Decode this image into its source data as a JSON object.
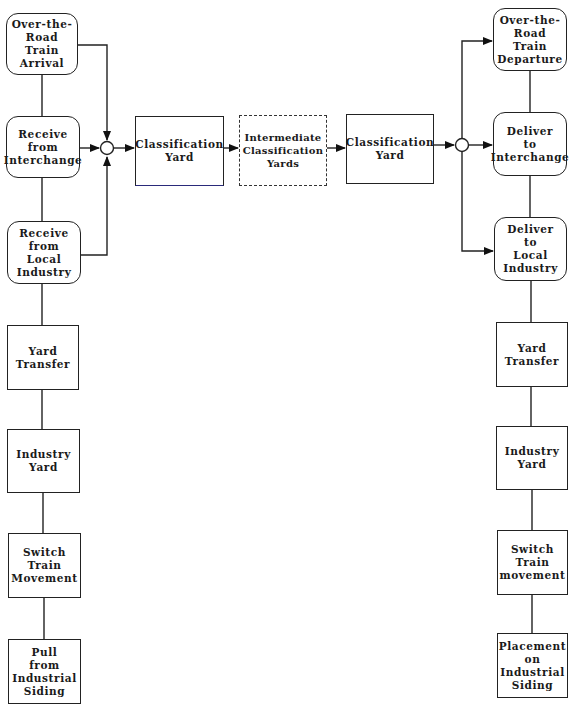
{
  "diagram": {
    "left_column": [
      {
        "id": "otr-arrival",
        "label": "Over-the-\nRoad\nTrain\nArrival",
        "shape": "rounded"
      },
      {
        "id": "receive-interchange",
        "label": "Receive\nfrom\nInterchange",
        "shape": "rounded"
      },
      {
        "id": "receive-local-industry",
        "label": "Receive\nfrom\nLocal\nIndustry",
        "shape": "rounded"
      },
      {
        "id": "yard-transfer-left",
        "label": "Yard\nTransfer",
        "shape": "rect"
      },
      {
        "id": "industry-yard-left",
        "label": "Industry\nYard",
        "shape": "rect"
      },
      {
        "id": "switch-train-left",
        "label": "Switch\nTrain\nMovement",
        "shape": "rect"
      },
      {
        "id": "pull-from-siding",
        "label": "Pull\nfrom\nIndustrial\nSiding",
        "shape": "rect"
      }
    ],
    "center_row": [
      {
        "id": "classification-yard-1",
        "label": "Classification\nYard",
        "shape": "rect"
      },
      {
        "id": "intermediate-yards",
        "label": "Intermediate\nClassification\nYards",
        "shape": "dashed"
      },
      {
        "id": "classification-yard-2",
        "label": "Classification\nYard",
        "shape": "rect"
      }
    ],
    "right_column": [
      {
        "id": "otr-departure",
        "label": "Over-the-\nRoad\nTrain\nDeparture",
        "shape": "rounded"
      },
      {
        "id": "deliver-interchange",
        "label": "Deliver\nto\nInterchange",
        "shape": "rounded"
      },
      {
        "id": "deliver-local-industry",
        "label": "Deliver\nto\nLocal\nIndustry",
        "shape": "rounded"
      },
      {
        "id": "yard-transfer-right",
        "label": "Yard\nTransfer",
        "shape": "rect"
      },
      {
        "id": "industry-yard-right",
        "label": "Industry\nYard",
        "shape": "rect"
      },
      {
        "id": "switch-train-right",
        "label": "Switch\nTrain\nmovement",
        "shape": "rect"
      },
      {
        "id": "placement-on-siding",
        "label": "Placement\non\nIndustrial\nSiding",
        "shape": "rect"
      }
    ],
    "junctions": [
      "merge-junction",
      "split-junction"
    ],
    "colors": {
      "line": "#222222",
      "background": "#ffffff"
    }
  }
}
